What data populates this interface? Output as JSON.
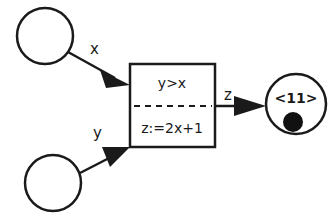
{
  "diagram": {
    "type": "petri-net-transition",
    "colors": {
      "stroke": "#1a1a1a",
      "fill": "#ffffff",
      "token": "#111111"
    },
    "input_places": [
      {
        "id": "place-x",
        "arc_label": "x"
      },
      {
        "id": "place-y",
        "arc_label": "y"
      }
    ],
    "transition": {
      "guard": "y>x",
      "action": "z:=2x+1"
    },
    "output_arc_label": "z",
    "output_place": {
      "id": "place-z",
      "token_value": "<11>",
      "has_token": true
    }
  }
}
